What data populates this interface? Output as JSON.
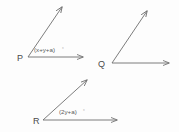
{
  "figure": {
    "type": "geometry-angle-diagram",
    "background_color": "#fdfdfd",
    "stroke_color": "#6e6e6e",
    "text_color": "#4a4a4a",
    "angles": [
      {
        "id": "angle-p",
        "vertex_label": "P",
        "vertex": [
          28,
          57
        ],
        "measure_label": "(x+y+a)",
        "degree_symbol": "°",
        "rays": [
          {
            "name": "ray-p-diagonal",
            "to": [
              64,
              5
            ],
            "arrow": true
          },
          {
            "name": "ray-p-horizontal",
            "to": [
              86,
              57
            ],
            "arrow": true
          }
        ],
        "label_position": [
          34,
          52
        ]
      },
      {
        "id": "angle-q",
        "vertex_label": "Q",
        "vertex": [
          112,
          63
        ],
        "measure_label": "",
        "degree_symbol": "",
        "rays": [
          {
            "name": "ray-q-diagonal",
            "to": [
              149,
              9
            ],
            "arrow": true
          },
          {
            "name": "ray-q-horizontal",
            "to": [
              172,
              63
            ],
            "arrow": true
          }
        ],
        "label_position": [
          101,
          66
        ]
      },
      {
        "id": "angle-r",
        "vertex_label": "R",
        "vertex": [
          43,
          120
        ],
        "measure_label": "(2y+a)",
        "degree_symbol": "°",
        "rays": [
          {
            "name": "ray-r-diagonal",
            "to": [
              89,
              78
            ],
            "arrow": true
          },
          {
            "name": "ray-r-horizontal",
            "to": [
              120,
              120
            ],
            "arrow": true
          }
        ],
        "label_position": [
          59,
          114
        ]
      }
    ]
  }
}
